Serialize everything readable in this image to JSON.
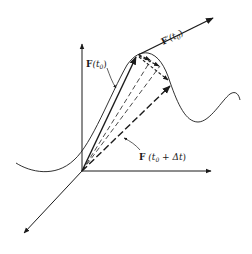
{
  "diagram": {
    "type": "vector-calculus-derivative-illustration",
    "labels": {
      "position_vector": {
        "bold": "F",
        "arg": "(t",
        "sub": "0",
        "close": ")"
      },
      "derivative_vector": {
        "bold": "F",
        "prime": "′",
        "arg": "(t",
        "sub": "0",
        "close": ")"
      },
      "displaced_vector": {
        "bold": "F",
        "arg": " (t",
        "sub": "0",
        "plus": " + Δt",
        "close": ")"
      }
    },
    "colors": {
      "ink": "#1a1a1a",
      "background": "#ffffff"
    },
    "axes": [
      "z-vertical",
      "y-horizontal",
      "x-diagonal"
    ],
    "elements": {
      "curve": "space-curve",
      "solid_vector": "F(t0)",
      "dashed_vectors_count": 3,
      "secant_arrows_count": 3,
      "tangent_vector": "F'(t0)"
    }
  }
}
